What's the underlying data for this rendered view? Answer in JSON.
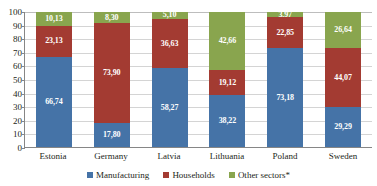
{
  "chart_data": {
    "type": "bar",
    "subtype": "stacked-100-percent",
    "title": "",
    "subtitle": "",
    "xlabel": "",
    "ylabel": "",
    "ylim": [
      0,
      100
    ],
    "ytick_step": 10,
    "yticks": [
      "100",
      "90",
      "80",
      "70",
      "60",
      "50",
      "40",
      "30",
      "20",
      "10",
      "0"
    ],
    "grid": true,
    "legend_position": "bottom",
    "categories": [
      "Estonia",
      "Germany",
      "Latvia",
      "Lithuania",
      "Poland",
      "Sweden"
    ],
    "series": [
      {
        "name": "Manufacturing",
        "color": "#4573a7",
        "values": [
          66.74,
          17.8,
          58.27,
          38.22,
          73.18,
          29.29
        ],
        "labels": [
          "66,74",
          "17,80",
          "58,27",
          "38,22",
          "73,18",
          "29,29"
        ]
      },
      {
        "name": "Households",
        "color": "#a33b32",
        "values": [
          23.13,
          73.9,
          36.63,
          19.12,
          22.85,
          44.07
        ],
        "labels": [
          "23,13",
          "73,90",
          "36,63",
          "19,12",
          "22,85",
          "44,07"
        ]
      },
      {
        "name": "Other sectors*",
        "color": "#89a54e",
        "values": [
          10.13,
          8.3,
          5.1,
          42.66,
          3.97,
          26.64
        ],
        "labels": [
          "10,13",
          "8,30",
          "5,10",
          "42,66",
          "3,97",
          "26,64"
        ]
      }
    ]
  },
  "colors": {
    "manufacturing": "#4573a7",
    "households": "#a33b32",
    "other_sectors": "#89a54e",
    "gridline": "#d4d4d4",
    "axis": "#868686",
    "text": "#231f20",
    "value_label": "#ffffff",
    "background": "#ffffff"
  }
}
